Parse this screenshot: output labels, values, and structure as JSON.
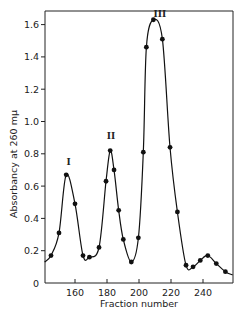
{
  "chart_data": {
    "type": "line",
    "title": "",
    "xlabel": "Fraction number",
    "ylabel": "Absorbancy at 260 mμ",
    "xlim": [
      141,
      258.5
    ],
    "ylim": [
      0,
      1.68
    ],
    "grid": false,
    "legend": null,
    "x_ticks": [
      160,
      180,
      200,
      220,
      240
    ],
    "x_tick_labels": [
      "160",
      "180",
      "200",
      "220",
      "240"
    ],
    "y_ticks": [
      0,
      0.2,
      0.4,
      0.6,
      0.8,
      1.0,
      1.2,
      1.4,
      1.6
    ],
    "y_tick_labels": [
      "0",
      "0.2",
      "0.4",
      "0.6",
      "0.8",
      "1.0",
      "1.2",
      "1.4",
      "1.6"
    ],
    "series": [
      {
        "name": "Absorbancy",
        "marker": "filled-circle",
        "x": [
          145,
          150,
          154.5,
          160,
          165,
          169,
          175,
          179.4,
          182,
          184.4,
          187.3,
          190.2,
          195.2,
          199.6,
          202.7,
          204.6,
          209,
          214.6,
          219.4,
          224,
          229.4,
          233.8,
          238.3,
          243,
          248.3,
          254
        ],
        "y": [
          0.17,
          0.31,
          0.67,
          0.49,
          0.17,
          0.16,
          0.22,
          0.63,
          0.82,
          0.7,
          0.45,
          0.27,
          0.13,
          0.28,
          0.81,
          1.46,
          1.63,
          1.51,
          0.84,
          0.44,
          0.11,
          0.1,
          0.14,
          0.17,
          0.12,
          0.07
        ]
      }
    ],
    "curve_endpoints": {
      "start": [
        141,
        0.13
      ],
      "end": [
        258.5,
        0.05
      ]
    },
    "annotations": [
      {
        "text": "I",
        "x": 156,
        "y": 0.73
      },
      {
        "text": "II",
        "x": 182.5,
        "y": 0.89
      },
      {
        "text": "III",
        "x": 213,
        "y": 1.65
      }
    ]
  }
}
